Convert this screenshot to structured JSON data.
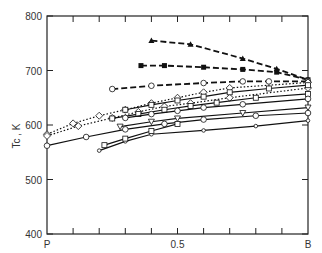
{
  "chart_data": {
    "type": "line",
    "title": "",
    "xlabel": "",
    "ylabel": "Tc , K",
    "xlim": [
      0,
      1
    ],
    "ylim": [
      400,
      800
    ],
    "x_tick_labels": [
      {
        "x": 0,
        "label": "P"
      },
      {
        "x": 0.5,
        "label": "0.5"
      },
      {
        "x": 1,
        "label": "B"
      }
    ],
    "y_ticks": [
      400,
      500,
      600,
      700,
      800
    ],
    "grid": false,
    "legend": null,
    "series": [
      {
        "name": "dashed-triangles",
        "style": "dashed",
        "marker": "filled-triangle",
        "x": [
          0.4,
          0.55,
          0.75,
          0.88,
          1.0
        ],
        "y": [
          755,
          748,
          722,
          703,
          683
        ]
      },
      {
        "name": "dashed-squares",
        "style": "dashed",
        "marker": "filled-square",
        "x": [
          0.36,
          0.45,
          0.6,
          0.75,
          0.88,
          1.0
        ],
        "y": [
          709,
          709,
          706,
          702,
          697,
          683
        ]
      },
      {
        "name": "dashed-circles",
        "style": "dashed",
        "marker": "open-circle",
        "x": [
          0.25,
          0.4,
          0.6,
          0.75,
          0.85,
          1.0
        ],
        "y": [
          666,
          672,
          677,
          680,
          680,
          680
        ]
      },
      {
        "name": "dotted-diamonds-1",
        "style": "dotted",
        "marker": "open-diamond",
        "x": [
          0.0,
          0.1,
          0.2,
          0.3,
          0.4,
          0.5,
          0.6,
          0.7,
          1.0
        ],
        "y": [
          583,
          603,
          617,
          628,
          640,
          650,
          660,
          668,
          678
        ]
      },
      {
        "name": "dotted-diamonds-2",
        "style": "dotted",
        "marker": "open-diamond",
        "x": [
          0.0,
          0.12,
          0.25,
          0.35,
          0.45,
          0.55,
          0.7,
          1.0
        ],
        "y": [
          580,
          598,
          613,
          624,
          634,
          640,
          650,
          668
        ]
      },
      {
        "name": "solid-squares-1",
        "style": "solid",
        "marker": "open-square",
        "x": [
          0.3,
          0.4,
          0.5,
          0.6,
          0.7,
          0.85,
          1.0
        ],
        "y": [
          628,
          637,
          645,
          652,
          660,
          667,
          673
        ]
      },
      {
        "name": "solid-squares-2",
        "style": "solid",
        "marker": "open-square",
        "x": [
          0.25,
          0.35,
          0.45,
          0.55,
          0.65,
          0.8,
          1.0
        ],
        "y": [
          612,
          620,
          628,
          635,
          641,
          650,
          657
        ]
      },
      {
        "name": "solid-circles-1",
        "style": "solid",
        "marker": "open-circle",
        "x": [
          0.3,
          0.4,
          0.5,
          0.6,
          0.75,
          1.0
        ],
        "y": [
          613,
          620,
          626,
          632,
          638,
          648
        ]
      },
      {
        "name": "solid-triangles-down",
        "style": "solid",
        "marker": "open-triangle",
        "x": [
          0.28,
          0.4,
          0.5,
          0.75,
          1.0
        ],
        "y": [
          597,
          606,
          612,
          622,
          632
        ]
      },
      {
        "name": "solid-circles-2",
        "style": "solid",
        "marker": "open-circle",
        "x": [
          0.0,
          0.15,
          0.3,
          0.45,
          0.6,
          0.8,
          1.0
        ],
        "y": [
          562,
          578,
          592,
          602,
          610,
          617,
          622
        ]
      },
      {
        "name": "solid-small-circles",
        "style": "solid",
        "marker": "small-open-circle",
        "x": [
          0.2,
          0.3,
          0.4,
          0.6,
          0.8,
          1.0
        ],
        "y": [
          553,
          570,
          583,
          590,
          598,
          608
        ]
      },
      {
        "name": "solid-short",
        "style": "solid",
        "marker": "open-square",
        "x": [
          0.22,
          0.3,
          0.4,
          0.5
        ],
        "y": [
          563,
          575,
          589,
          602
        ]
      }
    ]
  }
}
